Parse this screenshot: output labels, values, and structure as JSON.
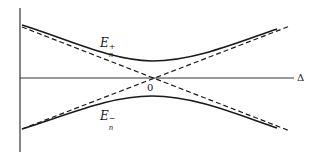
{
  "figure": {
    "type": "energy level avoided-crossing diagram",
    "upper_branch_label": {
      "base": "E",
      "subscript": "n",
      "superscript": "+"
    },
    "lower_branch_label": {
      "base": "E",
      "subscript": "n",
      "superscript": "−"
    },
    "origin_label": "0",
    "horizontal_axis_label": "Δ",
    "line_styles": {
      "solid_curves": "adiabatic energies E_n^+ and E_n^- (hyperbolic, avoided crossing)",
      "dashed_lines": "diabatic asymptotes crossing at origin"
    },
    "colors": {
      "stroke": "#1a1a1a",
      "axis": "#333333",
      "background": "#ffffff"
    }
  }
}
